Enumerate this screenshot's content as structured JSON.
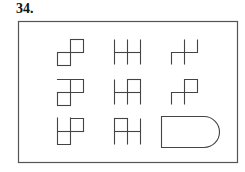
{
  "question": {
    "number": "34."
  },
  "puzzle": {
    "layout": "3x3 matrix",
    "frame_color": "#555555",
    "stroke_color": "#444444",
    "cells": [
      {
        "row": 1,
        "col": 1,
        "figure": "two squares joined diagonally at a corner (lower-left and upper-right)"
      },
      {
        "row": 1,
        "col": 2,
        "figure": "three vertical lines crossed by one horizontal line"
      },
      {
        "row": 1,
        "col": 3,
        "figure": "two vertical lines joined by a horizontal segment, hook shape"
      },
      {
        "row": 2,
        "col": 1,
        "figure": "square with an open square on the upper right"
      },
      {
        "row": 2,
        "col": 2,
        "figure": "three vertical lines with horizontal crossbar and a top cap on the right"
      },
      {
        "row": 2,
        "col": 3,
        "figure": "hook with a closed square on the upper right"
      },
      {
        "row": 3,
        "col": 1,
        "figure": "open square lower-left with closed square upper-right"
      },
      {
        "row": 3,
        "col": 2,
        "figure": "three vertical lines with top cap on the left and crossbar"
      },
      {
        "row": 3,
        "col": 3,
        "figure": "answer placeholder: rounded-end rectangle"
      }
    ]
  }
}
